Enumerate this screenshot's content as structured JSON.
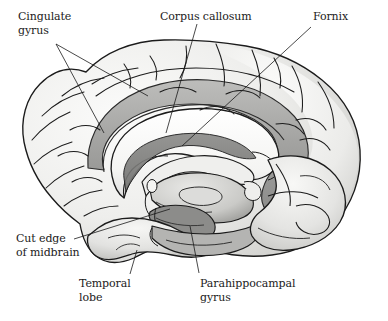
{
  "figure": {
    "style": "grayscale pen-and-ink anatomical illustration",
    "background_color": "#ffffff",
    "ink_color": "#1b1b1b",
    "tones": {
      "cortex_light": "#f2f2f0",
      "cortex_mid": "#d6d6d4",
      "cingulate_band": "#a8a8a6",
      "deep_shadow": "#6f6f6e",
      "corpus_callosum_white": "#fbfbfa",
      "ventricle_dark": "#8a8a88"
    }
  },
  "labels": [
    {
      "id": "cingulate-gyrus",
      "text_lines": [
        "Cingulate",
        "gyrus"
      ],
      "x": 18,
      "y": 10,
      "align": "left",
      "leaders": [
        {
          "x1": 56,
          "y1": 44,
          "x2": 148,
          "y2": 96
        },
        {
          "x1": 56,
          "y1": 44,
          "x2": 104,
          "y2": 133
        }
      ]
    },
    {
      "id": "corpus-callosum",
      "text_lines": [
        "Corpus callosum"
      ],
      "x": 160,
      "y": 10,
      "align": "left",
      "leaders": [
        {
          "x1": 197,
          "y1": 24,
          "x2": 166,
          "y2": 133
        }
      ]
    },
    {
      "id": "fornix",
      "text_lines": [
        "Fornix"
      ],
      "x": 313,
      "y": 10,
      "align": "left",
      "leaders": [
        {
          "x1": 311,
          "y1": 27,
          "x2": 182,
          "y2": 146
        }
      ]
    },
    {
      "id": "cut-edge-of-midbrain",
      "text_lines": [
        "Cut edge",
        "of midbrain"
      ],
      "x": 16,
      "y": 232,
      "align": "left",
      "leaders": [
        {
          "x1": 74,
          "y1": 239,
          "x2": 170,
          "y2": 209
        }
      ]
    },
    {
      "id": "temporal-lobe",
      "text_lines": [
        "Temporal",
        "lobe"
      ],
      "x": 79,
      "y": 277,
      "align": "left",
      "leaders": [
        {
          "x1": 130,
          "y1": 274,
          "x2": 137,
          "y2": 250
        }
      ]
    },
    {
      "id": "parahippocampal-gyrus",
      "text_lines": [
        "Parahippocampal",
        "gyrus"
      ],
      "x": 200,
      "y": 277,
      "align": "left",
      "leaders": [
        {
          "x1": 199,
          "y1": 273,
          "x2": 190,
          "y2": 226
        }
      ]
    }
  ]
}
